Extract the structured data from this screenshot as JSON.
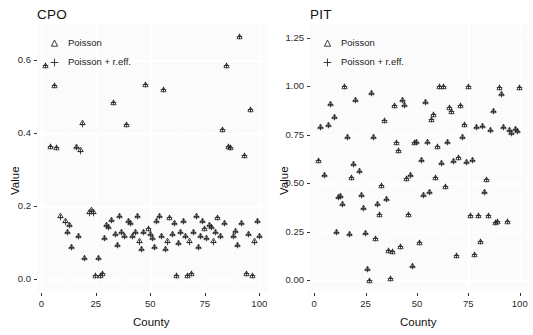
{
  "figure": {
    "type": "scatter-facets",
    "background": "#ffffff",
    "panel_background": "#fbfbfb",
    "marker_color": "#262626"
  },
  "legend": {
    "entries": [
      {
        "label": "Poisson",
        "marker": "triangle-open",
        "key_icon": "triangle-icon"
      },
      {
        "label": "Poisson + r.eff.",
        "marker": "plus",
        "key_icon": "plus-icon"
      }
    ]
  },
  "chart_data": [
    {
      "type": "scatter",
      "title": "CPO",
      "xlabel": "County",
      "ylabel": "Value",
      "xlim": [
        -2,
        104
      ],
      "ylim": [
        -0.035,
        0.7
      ],
      "xticks": [
        0,
        25,
        50,
        75,
        100
      ],
      "xticklabels": [
        "0",
        "25",
        "50",
        "75",
        "100"
      ],
      "yticks": [
        0.0,
        0.2,
        0.4,
        0.6
      ],
      "yticklabels": [
        "0.0",
        "0.2",
        "0.4",
        "0.6"
      ],
      "grid": true,
      "legend_position": "top-left-inside",
      "series": [
        {
          "name": "Poisson",
          "marker": "triangle-open",
          "x": [
            2,
            4,
            6,
            7,
            9,
            11,
            12,
            13,
            14,
            16,
            17,
            18,
            19,
            20,
            22,
            23,
            24,
            25,
            26,
            27,
            28,
            29,
            30,
            31,
            32,
            33,
            34,
            35,
            36,
            37,
            38,
            39,
            40,
            41,
            42,
            43,
            44,
            45,
            46,
            47,
            48,
            49,
            50,
            51,
            52,
            53,
            54,
            55,
            56,
            57,
            58,
            59,
            60,
            61,
            62,
            63,
            64,
            65,
            66,
            67,
            68,
            69,
            70,
            71,
            72,
            73,
            74,
            75,
            76,
            77,
            78,
            79,
            80,
            81,
            82,
            83,
            84,
            85,
            86,
            87,
            88,
            89,
            90,
            91,
            92,
            93,
            94,
            95,
            96,
            97,
            98,
            99,
            100
          ],
          "y": [
            0.585,
            0.365,
            0.53,
            0.36,
            0.175,
            0.16,
            0.13,
            0.15,
            0.09,
            0.365,
            0.12,
            0.355,
            0.43,
            0.06,
            0.185,
            0.19,
            0.185,
            0.01,
            0.06,
            0.01,
            0.015,
            0.115,
            0.15,
            0.145,
            0.165,
            0.485,
            0.125,
            0.095,
            0.175,
            0.13,
            0.12,
            0.425,
            0.16,
            0.155,
            0.12,
            0.13,
            0.175,
            0.105,
            0.085,
            0.13,
            0.535,
            0.14,
            0.125,
            0.115,
            0.09,
            0.16,
            0.175,
            0.12,
            0.52,
            0.085,
            0.105,
            0.17,
            0.125,
            0.155,
            0.01,
            0.1,
            0.13,
            0.16,
            0.12,
            0.01,
            0.105,
            0.015,
            0.13,
            0.175,
            0.09,
            0.12,
            0.16,
            0.14,
            0.115,
            0.15,
            0.145,
            0.105,
            0.13,
            0.17,
            0.12,
            0.41,
            0.155,
            0.585,
            0.365,
            0.36,
            0.12,
            0.135,
            0.095,
            0.665,
            0.155,
            0.34,
            0.015,
            0.125,
            0.465,
            0.01,
            0.105,
            0.16,
            0.12
          ]
        },
        {
          "name": "Poisson + r.eff.",
          "marker": "plus",
          "x": [
            2,
            4,
            6,
            7,
            9,
            11,
            12,
            13,
            14,
            16,
            17,
            18,
            19,
            20,
            22,
            23,
            24,
            25,
            26,
            27,
            28,
            29,
            30,
            31,
            32,
            33,
            34,
            35,
            36,
            37,
            38,
            39,
            40,
            41,
            42,
            43,
            44,
            45,
            46,
            47,
            48,
            49,
            50,
            51,
            52,
            53,
            54,
            55,
            56,
            57,
            58,
            59,
            60,
            61,
            62,
            63,
            64,
            65,
            66,
            67,
            68,
            69,
            70,
            71,
            72,
            73,
            74,
            75,
            76,
            77,
            78,
            79,
            80,
            81,
            82,
            83,
            84,
            85,
            86,
            87,
            88,
            89,
            90,
            91,
            92,
            93,
            94,
            95,
            96,
            97,
            98,
            99,
            100
          ],
          "y": [
            0.585,
            0.365,
            0.53,
            0.36,
            0.17,
            0.155,
            0.128,
            0.148,
            0.088,
            0.36,
            0.118,
            0.35,
            0.425,
            0.058,
            0.18,
            0.185,
            0.18,
            0.01,
            0.058,
            0.01,
            0.015,
            0.112,
            0.148,
            0.142,
            0.162,
            0.485,
            0.122,
            0.092,
            0.172,
            0.128,
            0.118,
            0.425,
            0.158,
            0.152,
            0.118,
            0.128,
            0.172,
            0.102,
            0.082,
            0.128,
            0.535,
            0.138,
            0.122,
            0.112,
            0.088,
            0.158,
            0.172,
            0.118,
            0.52,
            0.082,
            0.102,
            0.168,
            0.122,
            0.152,
            0.01,
            0.098,
            0.128,
            0.158,
            0.118,
            0.01,
            0.102,
            0.015,
            0.128,
            0.172,
            0.088,
            0.118,
            0.158,
            0.138,
            0.112,
            0.148,
            0.142,
            0.102,
            0.128,
            0.168,
            0.118,
            0.41,
            0.152,
            0.585,
            0.365,
            0.36,
            0.118,
            0.132,
            0.092,
            0.665,
            0.152,
            0.34,
            0.015,
            0.122,
            0.465,
            0.01,
            0.102,
            0.158,
            0.118
          ]
        }
      ]
    },
    {
      "type": "scatter",
      "title": "PIT",
      "xlabel": "County",
      "ylabel": "Value",
      "xlim": [
        -2,
        104
      ],
      "ylim": [
        -0.06,
        1.32
      ],
      "xticks": [
        0,
        25,
        50,
        75,
        100
      ],
      "xticklabels": [
        "0",
        "25",
        "50",
        "75",
        "100"
      ],
      "yticks": [
        0.0,
        0.25,
        0.5,
        0.75,
        1.0,
        1.25
      ],
      "yticklabels": [
        "0.00",
        "0.25",
        "0.50",
        "0.75",
        "1.00",
        "1.25"
      ],
      "grid": true,
      "legend_position": "top-left-inside",
      "series": [
        {
          "name": "Poisson",
          "marker": "triangle-open",
          "x": [
            2,
            3,
            5,
            7,
            8,
            10,
            11,
            12,
            13,
            14,
            15,
            16,
            17,
            18,
            19,
            20,
            22,
            23,
            24,
            25,
            26,
            27,
            28,
            29,
            30,
            31,
            32,
            33,
            34,
            35,
            36,
            37,
            38,
            39,
            40,
            41,
            42,
            43,
            44,
            45,
            46,
            47,
            48,
            49,
            50,
            51,
            52,
            53,
            54,
            55,
            56,
            57,
            58,
            59,
            60,
            61,
            62,
            63,
            64,
            65,
            66,
            67,
            68,
            69,
            70,
            71,
            72,
            73,
            74,
            75,
            76,
            77,
            78,
            79,
            80,
            81,
            82,
            83,
            84,
            85,
            86,
            87,
            88,
            89,
            90,
            91,
            92,
            94,
            95,
            96,
            98,
            99,
            100
          ],
          "y": [
            0.615,
            0.79,
            0.545,
            0.8,
            0.91,
            0.845,
            0.25,
            0.43,
            0.435,
            0.395,
            1.0,
            0.74,
            0.24,
            0.53,
            0.6,
            0.93,
            0.565,
            0.44,
            0.375,
            0.245,
            0.06,
            0.0,
            0.965,
            0.74,
            0.215,
            0.395,
            0.34,
            0.49,
            0.825,
            0.42,
            0.155,
            0.01,
            0.15,
            0.9,
            0.71,
            0.67,
            0.175,
            0.93,
            0.905,
            0.525,
            0.34,
            0.545,
            0.075,
            0.71,
            0.715,
            0.195,
            0.62,
            0.44,
            0.92,
            0.715,
            0.455,
            0.83,
            0.855,
            0.53,
            0.69,
            1.0,
            0.605,
            1.0,
            0.485,
            0.715,
            0.89,
            0.87,
            0.615,
            0.13,
            0.635,
            0.9,
            0.74,
            0.805,
            0.61,
            1.0,
            0.335,
            0.62,
            0.135,
            0.79,
            0.335,
            0.2,
            0.795,
            0.455,
            0.52,
            0.335,
            0.775,
            0.875,
            0.3,
            0.305,
            0.995,
            0.96,
            0.79,
            0.305,
            0.775,
            0.76,
            0.78,
            0.77,
            0.995
          ]
        },
        {
          "name": "Poisson + r.eff.",
          "marker": "plus",
          "x": [
            2,
            3,
            5,
            7,
            8,
            10,
            11,
            12,
            13,
            14,
            15,
            16,
            17,
            18,
            19,
            20,
            22,
            23,
            24,
            25,
            26,
            27,
            28,
            29,
            30,
            31,
            32,
            33,
            34,
            35,
            36,
            37,
            38,
            39,
            40,
            41,
            42,
            43,
            44,
            45,
            46,
            47,
            48,
            49,
            50,
            51,
            52,
            53,
            54,
            55,
            56,
            57,
            58,
            59,
            60,
            61,
            62,
            63,
            64,
            65,
            66,
            67,
            68,
            69,
            70,
            71,
            72,
            73,
            74,
            75,
            76,
            77,
            78,
            79,
            80,
            81,
            82,
            83,
            84,
            85,
            86,
            87,
            88,
            89,
            90,
            91,
            92,
            94,
            95,
            96,
            98,
            99,
            100
          ],
          "y": [
            0.615,
            0.785,
            0.54,
            0.795,
            0.905,
            0.84,
            0.248,
            0.428,
            0.432,
            0.392,
            1.0,
            0.738,
            0.238,
            0.528,
            0.598,
            0.928,
            0.562,
            0.438,
            0.372,
            0.243,
            0.058,
            0.0,
            0.962,
            0.738,
            0.213,
            0.392,
            0.338,
            0.488,
            0.822,
            0.418,
            0.153,
            0.01,
            0.148,
            0.898,
            0.708,
            0.668,
            0.173,
            0.928,
            0.902,
            0.522,
            0.338,
            0.542,
            0.073,
            0.708,
            0.712,
            0.193,
            0.618,
            0.438,
            0.918,
            0.712,
            0.452,
            0.828,
            0.852,
            0.528,
            0.688,
            1.0,
            0.602,
            1.0,
            0.482,
            0.712,
            0.888,
            0.868,
            0.612,
            0.128,
            0.632,
            0.898,
            0.738,
            0.802,
            0.608,
            1.0,
            0.332,
            0.618,
            0.133,
            0.788,
            0.332,
            0.198,
            0.792,
            0.452,
            0.518,
            0.332,
            0.772,
            0.872,
            0.298,
            0.303,
            0.992,
            0.958,
            0.788,
            0.303,
            0.772,
            0.758,
            0.778,
            0.768,
            0.992
          ]
        }
      ]
    }
  ]
}
